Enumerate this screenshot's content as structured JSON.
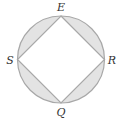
{
  "diagram": {
    "circle": {
      "cx": 61,
      "cy": 59.5,
      "r": 43.5
    },
    "vertices": [
      {
        "name": "E",
        "x": 61,
        "y": 16,
        "label_x": 61,
        "label_y": 11
      },
      {
        "name": "R",
        "x": 104.5,
        "y": 59.5,
        "label_x": 112,
        "label_y": 63.5
      },
      {
        "name": "Q",
        "x": 61,
        "y": 103,
        "label_x": 61,
        "label_y": 116
      },
      {
        "name": "S",
        "x": 17.5,
        "y": 59.5,
        "label_x": 10,
        "label_y": 63.5
      }
    ],
    "colors": {
      "shade": "#e3e3e3",
      "stroke": "#a8a8a8",
      "square_fill": "#ffffff",
      "label": "#333333"
    }
  }
}
